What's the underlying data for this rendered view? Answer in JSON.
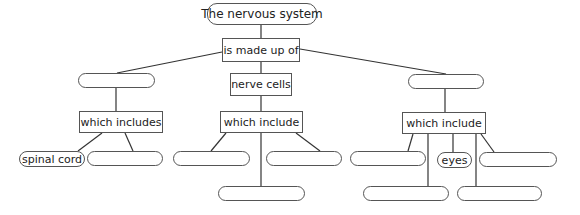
{
  "diagram": {
    "title_node": "The nervous system",
    "relation_top": "is made up of",
    "branches": {
      "left": {
        "node": "",
        "relation": "which includes",
        "children": [
          "spinal cord",
          ""
        ]
      },
      "middle": {
        "node": "nerve cells",
        "relation": "which include",
        "children": [
          "",
          "",
          ""
        ]
      },
      "right": {
        "node": "",
        "relation": "which include",
        "children": [
          "",
          "eyes",
          "",
          "",
          ""
        ]
      }
    }
  }
}
